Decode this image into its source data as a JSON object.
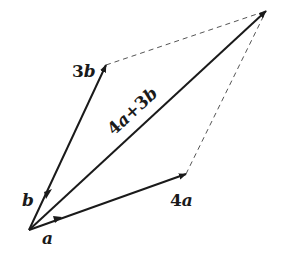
{
  "diagram": {
    "type": "vector-parallelogram",
    "stroke_color": "#1a1a1a",
    "dash_color": "#555555",
    "origin": [
      29,
      230
    ],
    "vectors": [
      {
        "id": "a",
        "label": "a",
        "tip": [
          61,
          218
        ]
      },
      {
        "id": "b",
        "label": "b",
        "tip": [
          49,
          189
        ]
      },
      {
        "id": "4a",
        "label_coef": "4",
        "label_var": "a",
        "tip": [
          186,
          174
        ]
      },
      {
        "id": "3b",
        "label_coef": "3",
        "label_var": "b",
        "tip": [
          106,
          65
        ]
      },
      {
        "id": "sum",
        "label": "4a+3b",
        "tip": [
          266,
          11
        ]
      }
    ],
    "labels": {
      "a": "a",
      "b": "b",
      "three_b_coef": "3",
      "three_b_var": "b",
      "four_a_coef": "4",
      "four_a_var": "a",
      "sum_p1": "4",
      "sum_p2": "a",
      "sum_p3": "+3",
      "sum_p4": "b"
    }
  }
}
